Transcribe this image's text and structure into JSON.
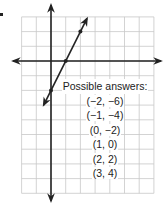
{
  "figure": {
    "origin_px": {
      "x": 51,
      "y": 61
    },
    "unit_px": 14.7,
    "grid": {
      "x_min": -2,
      "x_max": 7,
      "y_min": -9,
      "y_max": 3,
      "color": "#c8c8c8"
    },
    "axes": {
      "color": "#222222",
      "x_axis_arrows": "both",
      "y_axis_arrows": "both"
    },
    "line": {
      "equation": "y = 2x - 2",
      "slope": 2,
      "y_intercept": -2,
      "from": {
        "x": -0.5,
        "y": -3
      },
      "to": {
        "x": 2.45,
        "y": 2.9
      },
      "arrows": "both",
      "color": "#222222",
      "marked_points": [
        {
          "x": 0,
          "y": -2
        },
        {
          "x": 1,
          "y": 0
        },
        {
          "x": 2,
          "y": 2
        }
      ]
    }
  },
  "answers": {
    "heading": "Possible answers:",
    "items": [
      "(−2, −6)",
      "(−1, −4)",
      "(0, −2)",
      "(1, 0)",
      "(2, 2)",
      "(3, 4)"
    ]
  }
}
